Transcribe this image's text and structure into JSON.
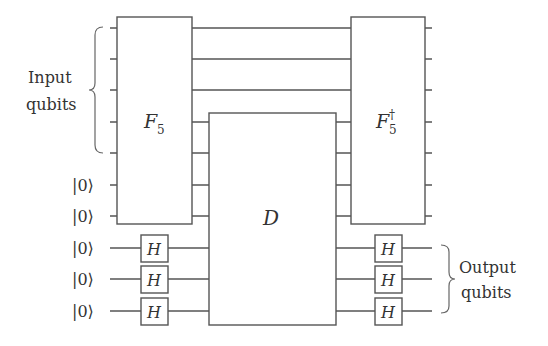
{
  "diagram": {
    "type": "quantum-circuit",
    "labels": {
      "input_group": [
        "Input",
        "qubits"
      ],
      "output_group": [
        "Output",
        "qubits"
      ],
      "ancilla_ket": "|0⟩",
      "f5_gate": "F",
      "f5_sub": "5",
      "f5_dag_gate": "F",
      "f5_dag_sub": "5",
      "f5_dag_sup": "†",
      "d_gate": "D",
      "h_gate": "H"
    },
    "wires": {
      "count": 10,
      "input_qubits": 5,
      "ancilla_into_f5": 2,
      "hadamard_ancillas": 3
    },
    "gates": [
      {
        "name": "F5",
        "spans_wires": [
          1,
          2,
          3,
          4,
          5,
          6,
          7
        ]
      },
      {
        "name": "D",
        "spans_wires": [
          4,
          5,
          6,
          7,
          8,
          9,
          10
        ]
      },
      {
        "name": "F5-dagger",
        "spans_wires": [
          1,
          2,
          3,
          4,
          5,
          6,
          7
        ]
      },
      {
        "name": "H",
        "wire": 8,
        "position": "before-D"
      },
      {
        "name": "H",
        "wire": 9,
        "position": "before-D"
      },
      {
        "name": "H",
        "wire": 10,
        "position": "before-D"
      },
      {
        "name": "H",
        "wire": 8,
        "position": "after-D"
      },
      {
        "name": "H",
        "wire": 9,
        "position": "after-D"
      },
      {
        "name": "H",
        "wire": 10,
        "position": "after-D"
      }
    ],
    "colors": {
      "line": "#555555",
      "text": "#333333",
      "background": "#ffffff"
    }
  }
}
